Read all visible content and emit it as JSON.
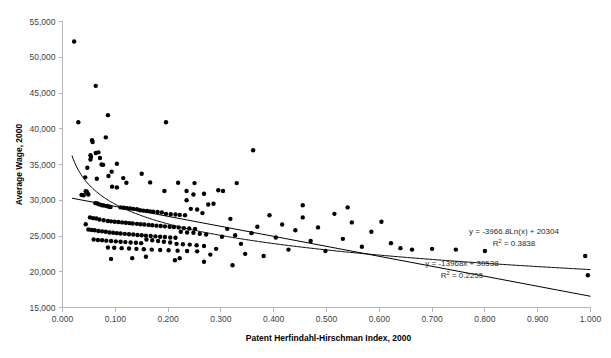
{
  "chart_data": {
    "type": "scatter",
    "title": "",
    "xlabel": "Patent Herfindahl-Hirschman Index, 2000",
    "ylabel": "Average Wage, 2000",
    "xlim": [
      0.0,
      1.0
    ],
    "ylim": [
      15000,
      55000
    ],
    "xticks": [
      0.0,
      0.1,
      0.2,
      0.3,
      0.4,
      0.5,
      0.6,
      0.7,
      0.8,
      0.9,
      1.0
    ],
    "xtick_labels": [
      "0.000",
      "0.100",
      "0.200",
      "0.300",
      "0.400",
      "0.500",
      "0.600",
      "0.700",
      "0.800",
      "0.900",
      "1.000"
    ],
    "yticks": [
      15000,
      20000,
      25000,
      30000,
      35000,
      40000,
      45000,
      50000,
      55000
    ],
    "ytick_labels": [
      "15,000",
      "20,000",
      "25,000",
      "30,000",
      "35,000",
      "40,000",
      "45,000",
      "50,000",
      "55,000"
    ],
    "grid": false,
    "legend": "none",
    "marker_color": "#000000",
    "marker_size": 2.2,
    "annotations": [
      {
        "name": "log-fit-equation",
        "line1": "y = -3966.8Ln(x) + 20304",
        "line2_prefix": "R",
        "line2_sup": "2",
        "line2_suffix": " = 0.3838"
      },
      {
        "name": "linear-fit-equation",
        "line1": "y = -13968x + 30538",
        "line2_prefix": "R",
        "line2_sup": "2",
        "line2_suffix": " = 0.2255"
      }
    ],
    "trendlines": [
      {
        "name": "logarithmic",
        "equation": "y = -3966.8Ln(x) + 20304",
        "r_squared": 0.3838,
        "type": "log",
        "a": -3966.8,
        "b": 20304
      },
      {
        "name": "linear",
        "equation": "y = -13968x + 30538",
        "r_squared": 0.2255,
        "type": "linear",
        "slope": -13968,
        "intercept": 30538
      }
    ],
    "points": [
      [
        0.022,
        52200
      ],
      [
        0.063,
        46000
      ],
      [
        0.086,
        41900
      ],
      [
        0.03,
        40900
      ],
      [
        0.196,
        40900
      ],
      [
        0.082,
        38800
      ],
      [
        0.056,
        38400
      ],
      [
        0.057,
        38150
      ],
      [
        0.068,
        36700
      ],
      [
        0.054,
        36050
      ],
      [
        0.053,
        35700
      ],
      [
        0.103,
        35100
      ],
      [
        0.074,
        35000
      ],
      [
        0.077,
        34950
      ],
      [
        0.047,
        34550
      ],
      [
        0.093,
        34000
      ],
      [
        0.053,
        36300
      ],
      [
        0.361,
        37000
      ],
      [
        0.063,
        36600
      ],
      [
        0.071,
        35900
      ],
      [
        0.043,
        33200
      ],
      [
        0.065,
        33000
      ],
      [
        0.087,
        33400
      ],
      [
        0.115,
        33100
      ],
      [
        0.15,
        33700
      ],
      [
        0.121,
        32450
      ],
      [
        0.166,
        32500
      ],
      [
        0.219,
        32450
      ],
      [
        0.25,
        32400
      ],
      [
        0.33,
        32400
      ],
      [
        0.295,
        31400
      ],
      [
        0.235,
        31300
      ],
      [
        0.193,
        31300
      ],
      [
        0.044,
        31250
      ],
      [
        0.046,
        31200
      ],
      [
        0.047,
        31000
      ],
      [
        0.049,
        30800
      ],
      [
        0.04,
        30700
      ],
      [
        0.036,
        30750
      ],
      [
        0.094,
        31900
      ],
      [
        0.103,
        31800
      ],
      [
        0.062,
        29600
      ],
      [
        0.066,
        29550
      ],
      [
        0.07,
        29400
      ],
      [
        0.075,
        29300
      ],
      [
        0.079,
        29250
      ],
      [
        0.084,
        29200
      ],
      [
        0.088,
        29100
      ],
      [
        0.091,
        29050
      ],
      [
        0.11,
        29000
      ],
      [
        0.116,
        28950
      ],
      [
        0.122,
        28900
      ],
      [
        0.128,
        28850
      ],
      [
        0.134,
        28800
      ],
      [
        0.141,
        28750
      ],
      [
        0.147,
        28600
      ],
      [
        0.153,
        28550
      ],
      [
        0.16,
        28500
      ],
      [
        0.166,
        28450
      ],
      [
        0.172,
        28400
      ],
      [
        0.18,
        28350
      ],
      [
        0.188,
        28300
      ],
      [
        0.196,
        28100
      ],
      [
        0.205,
        28050
      ],
      [
        0.214,
        28000
      ],
      [
        0.222,
        27950
      ],
      [
        0.232,
        27900
      ],
      [
        0.243,
        28800
      ],
      [
        0.255,
        28700
      ],
      [
        0.265,
        28200
      ],
      [
        0.276,
        29400
      ],
      [
        0.052,
        27600
      ],
      [
        0.058,
        27500
      ],
      [
        0.064,
        27450
      ],
      [
        0.07,
        27300
      ],
      [
        0.078,
        27200
      ],
      [
        0.086,
        27100
      ],
      [
        0.092,
        27050
      ],
      [
        0.099,
        27000
      ],
      [
        0.106,
        26950
      ],
      [
        0.113,
        26900
      ],
      [
        0.12,
        26850
      ],
      [
        0.127,
        26800
      ],
      [
        0.133,
        26750
      ],
      [
        0.141,
        26700
      ],
      [
        0.148,
        26650
      ],
      [
        0.155,
        26600
      ],
      [
        0.163,
        26550
      ],
      [
        0.17,
        26500
      ],
      [
        0.178,
        26450
      ],
      [
        0.186,
        26400
      ],
      [
        0.194,
        26350
      ],
      [
        0.203,
        26300
      ],
      [
        0.211,
        26250
      ],
      [
        0.22,
        26200
      ],
      [
        0.23,
        26100
      ],
      [
        0.24,
        26050
      ],
      [
        0.251,
        26000
      ],
      [
        0.044,
        26650
      ],
      [
        0.049,
        25900
      ],
      [
        0.055,
        25850
      ],
      [
        0.061,
        25800
      ],
      [
        0.068,
        25700
      ],
      [
        0.075,
        25650
      ],
      [
        0.082,
        25600
      ],
      [
        0.089,
        25500
      ],
      [
        0.096,
        25450
      ],
      [
        0.103,
        25400
      ],
      [
        0.11,
        25350
      ],
      [
        0.118,
        25300
      ],
      [
        0.126,
        25250
      ],
      [
        0.134,
        25200
      ],
      [
        0.142,
        25150
      ],
      [
        0.15,
        25100
      ],
      [
        0.158,
        25050
      ],
      [
        0.167,
        25000
      ],
      [
        0.176,
        24950
      ],
      [
        0.185,
        24900
      ],
      [
        0.194,
        24850
      ],
      [
        0.204,
        24800
      ],
      [
        0.214,
        24750
      ],
      [
        0.224,
        25600
      ],
      [
        0.236,
        25500
      ],
      [
        0.248,
        25450
      ],
      [
        0.26,
        25300
      ],
      [
        0.272,
        25200
      ],
      [
        0.059,
        24500
      ],
      [
        0.067,
        24450
      ],
      [
        0.075,
        24400
      ],
      [
        0.083,
        24350
      ],
      [
        0.092,
        24300
      ],
      [
        0.101,
        24250
      ],
      [
        0.11,
        24200
      ],
      [
        0.119,
        24150
      ],
      [
        0.129,
        24100
      ],
      [
        0.139,
        24050
      ],
      [
        0.149,
        24000
      ],
      [
        0.159,
        24500
      ],
      [
        0.17,
        24400
      ],
      [
        0.181,
        24300
      ],
      [
        0.192,
        24200
      ],
      [
        0.204,
        24100
      ],
      [
        0.216,
        23900
      ],
      [
        0.228,
        23850
      ],
      [
        0.241,
        23800
      ],
      [
        0.254,
        23700
      ],
      [
        0.268,
        23600
      ],
      [
        0.086,
        23400
      ],
      [
        0.098,
        23350
      ],
      [
        0.112,
        23300
      ],
      [
        0.126,
        23250
      ],
      [
        0.14,
        23200
      ],
      [
        0.154,
        23150
      ],
      [
        0.169,
        23100
      ],
      [
        0.185,
        23050
      ],
      [
        0.201,
        23000
      ],
      [
        0.218,
        22950
      ],
      [
        0.236,
        22900
      ],
      [
        0.255,
        22850
      ],
      [
        0.092,
        21800
      ],
      [
        0.158,
        22100
      ],
      [
        0.222,
        21900
      ],
      [
        0.28,
        22400
      ],
      [
        0.291,
        23200
      ],
      [
        0.302,
        24900
      ],
      [
        0.312,
        26000
      ],
      [
        0.318,
        27400
      ],
      [
        0.327,
        25100
      ],
      [
        0.338,
        23900
      ],
      [
        0.346,
        22500
      ],
      [
        0.358,
        25400
      ],
      [
        0.369,
        26300
      ],
      [
        0.381,
        22200
      ],
      [
        0.392,
        27900
      ],
      [
        0.404,
        24800
      ],
      [
        0.416,
        26600
      ],
      [
        0.428,
        23100
      ],
      [
        0.441,
        25800
      ],
      [
        0.455,
        27600
      ],
      [
        0.47,
        24300
      ],
      [
        0.484,
        26200
      ],
      [
        0.498,
        22900
      ],
      [
        0.515,
        28100
      ],
      [
        0.531,
        24600
      ],
      [
        0.548,
        26900
      ],
      [
        0.567,
        23500
      ],
      [
        0.585,
        25600
      ],
      [
        0.604,
        27000
      ],
      [
        0.622,
        24000
      ],
      [
        0.64,
        23300
      ],
      [
        0.662,
        23100
      ],
      [
        0.7,
        23200
      ],
      [
        0.745,
        23100
      ],
      [
        0.8,
        22900
      ],
      [
        0.455,
        29300
      ],
      [
        0.54,
        29000
      ],
      [
        0.286,
        29500
      ],
      [
        0.304,
        31300
      ],
      [
        0.268,
        30900
      ],
      [
        0.248,
        30800
      ],
      [
        0.235,
        30000
      ],
      [
        0.99,
        22200
      ],
      [
        0.995,
        19500
      ],
      [
        0.322,
        20900
      ],
      [
        0.268,
        21400
      ],
      [
        0.132,
        21900
      ],
      [
        0.213,
        21600
      ]
    ]
  }
}
